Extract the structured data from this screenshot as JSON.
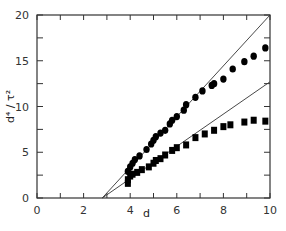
{
  "chart_data": {
    "type": "scatter",
    "title": "",
    "xlabel": "d",
    "ylabel": "d⁴ / τ²",
    "xlim": [
      0,
      10
    ],
    "ylim": [
      0,
      20
    ],
    "x_ticks": [
      0,
      2,
      4,
      6,
      8,
      10
    ],
    "x_tick_labels": [
      "0",
      "2",
      "4",
      "6",
      "8",
      "10"
    ],
    "y_ticks": [
      0,
      5,
      10,
      15,
      20
    ],
    "y_tick_labels": [
      "0",
      "5",
      "10",
      "15",
      "20"
    ],
    "grid": false,
    "legend": null,
    "series": [
      {
        "name": "circles",
        "marker": "circle",
        "points": [
          [
            3.9,
            2.9
          ],
          [
            4.0,
            3.4
          ],
          [
            4.1,
            3.8
          ],
          [
            4.2,
            4.2
          ],
          [
            4.4,
            4.6
          ],
          [
            4.7,
            5.3
          ],
          [
            4.9,
            5.9
          ],
          [
            5.0,
            6.3
          ],
          [
            5.1,
            6.7
          ],
          [
            5.3,
            7.1
          ],
          [
            5.5,
            7.4
          ],
          [
            5.7,
            8.1
          ],
          [
            5.8,
            8.5
          ],
          [
            6.0,
            8.9
          ],
          [
            6.3,
            9.6
          ],
          [
            6.4,
            10.2
          ],
          [
            6.8,
            11.0
          ],
          [
            7.1,
            11.7
          ],
          [
            7.5,
            12.3
          ],
          [
            7.6,
            12.5
          ],
          [
            8.0,
            13.0
          ],
          [
            8.4,
            14.1
          ],
          [
            8.9,
            14.9
          ],
          [
            9.3,
            15.5
          ],
          [
            9.8,
            16.4
          ]
        ]
      },
      {
        "name": "squares",
        "marker": "square",
        "points": [
          [
            3.9,
            1.6
          ],
          [
            3.9,
            2.0
          ],
          [
            4.0,
            2.4
          ],
          [
            4.1,
            2.6
          ],
          [
            4.3,
            2.8
          ],
          [
            4.5,
            3.1
          ],
          [
            4.8,
            3.4
          ],
          [
            5.0,
            3.8
          ],
          [
            5.1,
            4.1
          ],
          [
            5.3,
            4.3
          ],
          [
            5.5,
            4.7
          ],
          [
            5.8,
            5.2
          ],
          [
            6.0,
            5.5
          ],
          [
            6.4,
            5.8
          ],
          [
            6.8,
            6.6
          ],
          [
            7.2,
            7.0
          ],
          [
            7.6,
            7.4
          ],
          [
            8.0,
            7.8
          ],
          [
            8.3,
            8.0
          ],
          [
            8.9,
            8.3
          ],
          [
            9.3,
            8.5
          ],
          [
            9.8,
            8.4
          ]
        ]
      }
    ],
    "lines": [
      {
        "name": "upper-fit",
        "from": [
          2.8,
          0
        ],
        "to": [
          10,
          20
        ]
      },
      {
        "name": "lower-fit",
        "from": [
          2.8,
          0
        ],
        "to": [
          10,
          12.7
        ]
      }
    ]
  }
}
